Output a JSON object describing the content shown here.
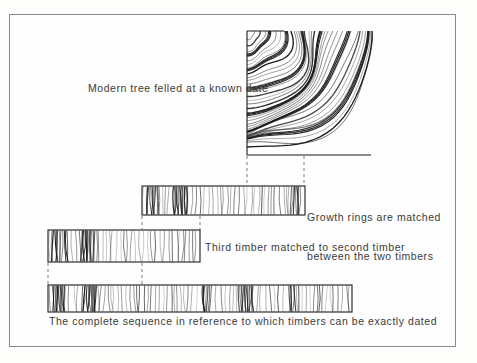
{
  "figure": {
    "background_color": "#fdfdfc",
    "ink_color": "#1a1a1a",
    "frame_color": "#8a8a8a",
    "text_color": "#3b3b3b"
  },
  "labels": {
    "modern_tree": "Modern tree felled at a known date",
    "growth_rings_line1": "Growth rings are matched",
    "growth_rings_line2": "between the two timbers",
    "third_timber": "Third timber matched to second timber",
    "complete_sequence": "The complete sequence in reference to which timbers can be exactly dated"
  },
  "diagram": {
    "tree_section": {
      "name": "quarter tree cross-section with growth rings",
      "pith_x": 247,
      "pith_y": 31,
      "right_x": 371,
      "bottom_y": 155,
      "ring_count": 34
    },
    "timbers": [
      {
        "name": "second-timber",
        "x": 142,
        "y": 186,
        "width": 163,
        "height": 29,
        "rings": 52
      },
      {
        "name": "third-timber",
        "x": 48,
        "y": 230,
        "width": 152,
        "height": 32,
        "rings": 48
      },
      {
        "name": "reference-sequence-timber",
        "x": 48,
        "y": 285,
        "width": 304,
        "height": 27,
        "rings": 96
      }
    ],
    "connectors": [
      {
        "name": "tree-to-second-left",
        "x": 247,
        "y1": 156,
        "y2": 186
      },
      {
        "name": "tree-to-second-right",
        "x": 304,
        "y1": 156,
        "y2": 186
      },
      {
        "name": "second-to-third-left",
        "x": 142,
        "y1": 216,
        "y2": 230
      },
      {
        "name": "second-to-third-right",
        "x": 200,
        "y1": 216,
        "y2": 230
      },
      {
        "name": "third-to-reference-left",
        "x": 48,
        "y1": 263,
        "y2": 285
      },
      {
        "name": "third-to-reference-right",
        "x": 142,
        "y1": 263,
        "y2": 285
      }
    ]
  }
}
